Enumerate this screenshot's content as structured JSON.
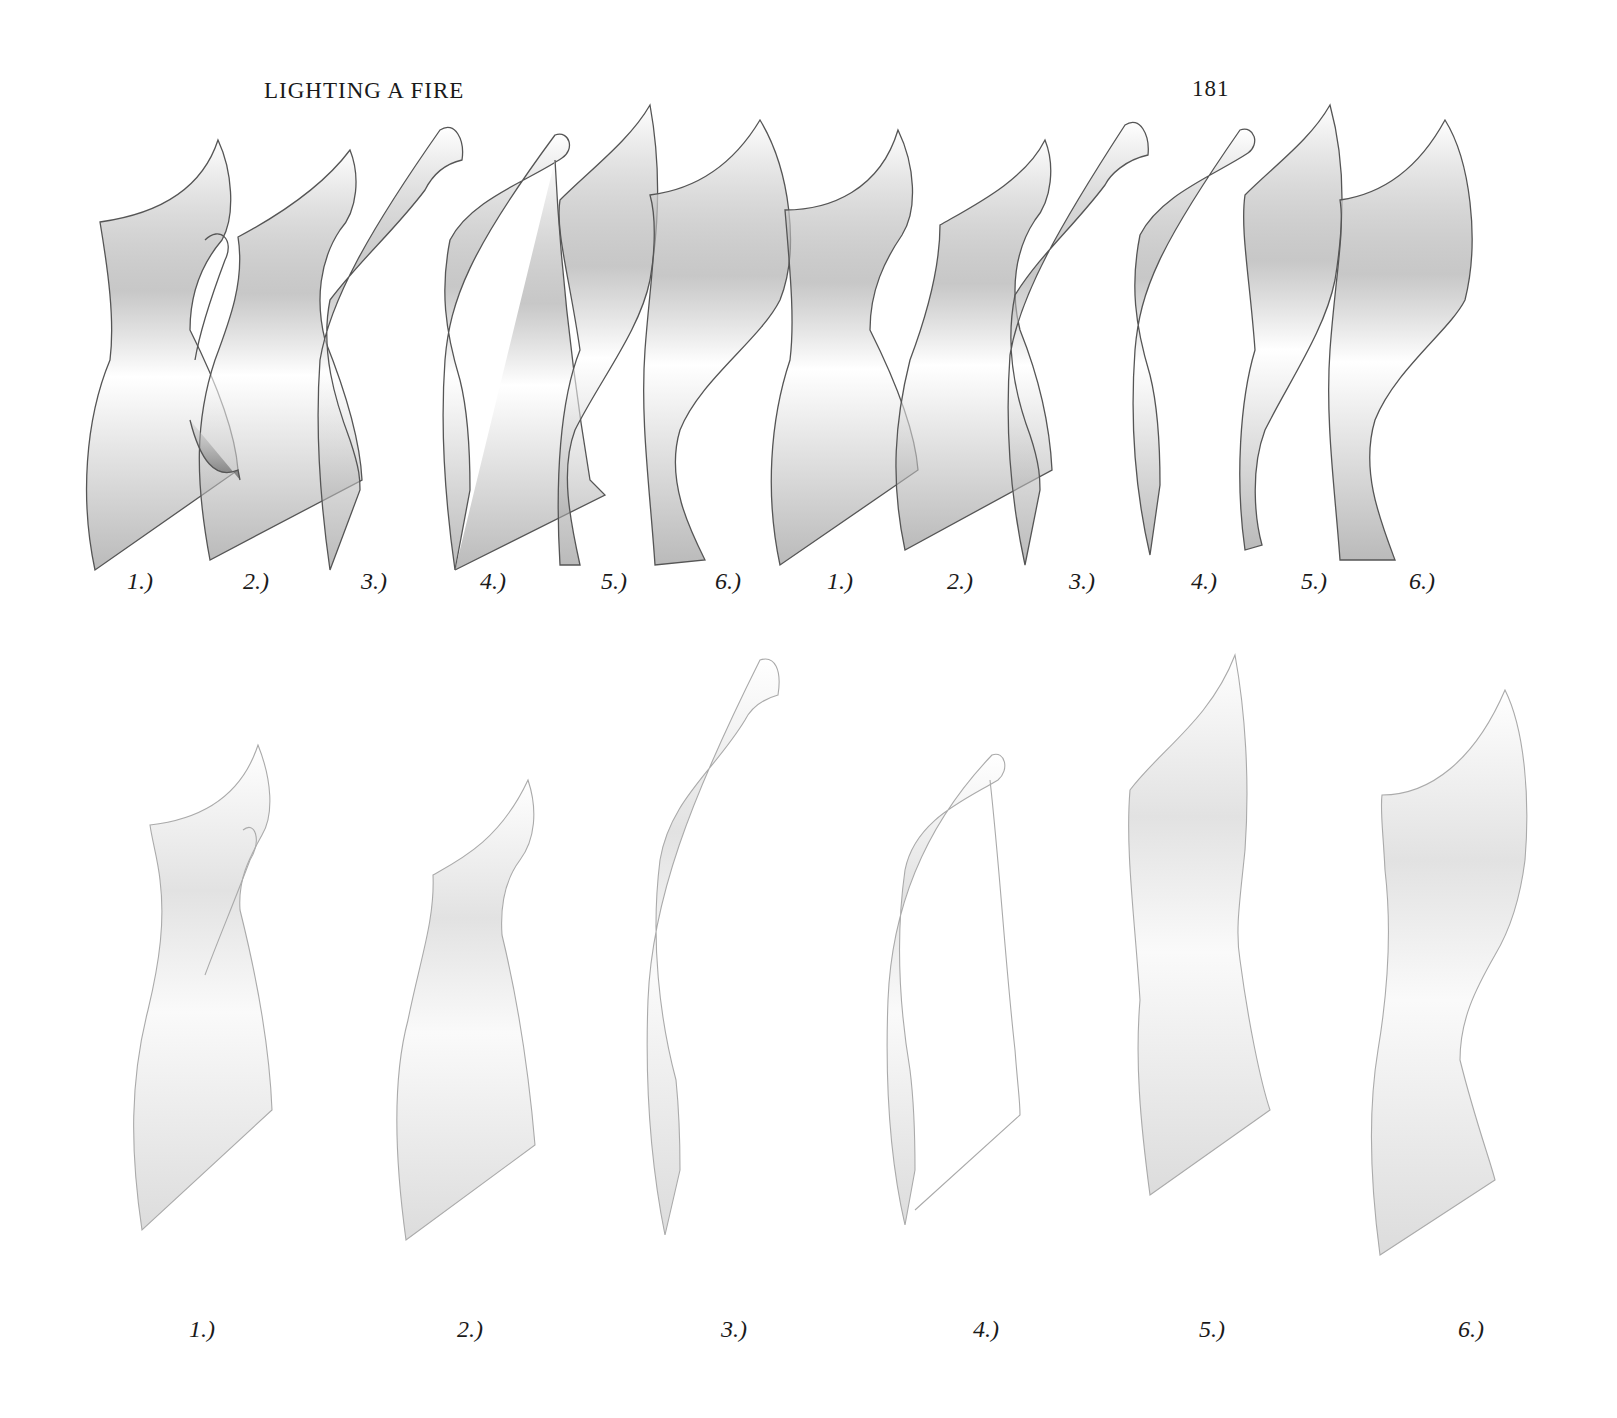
{
  "header": {
    "running_head": "LIGHTING A FIRE",
    "page_number": "181"
  },
  "figures": {
    "top_sequence": {
      "description": "Overlapping sequence of twisting paper sheet illustrations, two passes of six stages",
      "captions": [
        "1.)",
        "2.)",
        "3.)",
        "4.)",
        "5.)",
        "6.)",
        "1.)",
        "2.)",
        "3.)",
        "4.)",
        "5.)",
        "6.)"
      ],
      "caption_x": [
        140,
        256,
        374,
        493,
        614,
        728,
        840,
        960,
        1082,
        1204,
        1314,
        1422
      ],
      "caption_y": 586
    },
    "bottom_sequence": {
      "description": "Six separate stages of a twisting paper sheet, lightly shaded",
      "captions": [
        "1.)",
        "2.)",
        "3.)",
        "4.)",
        "5.)",
        "6.)"
      ],
      "caption_x": [
        202,
        470,
        734,
        986,
        1212,
        1471
      ],
      "caption_y": 1332
    }
  },
  "colors": {
    "ink": "#1a1a1a",
    "outline_top": "#555555",
    "outline_bottom": "#aaaaaa",
    "shade_dark": "#8a8a8a",
    "shade_light": "#e6e6e6"
  }
}
